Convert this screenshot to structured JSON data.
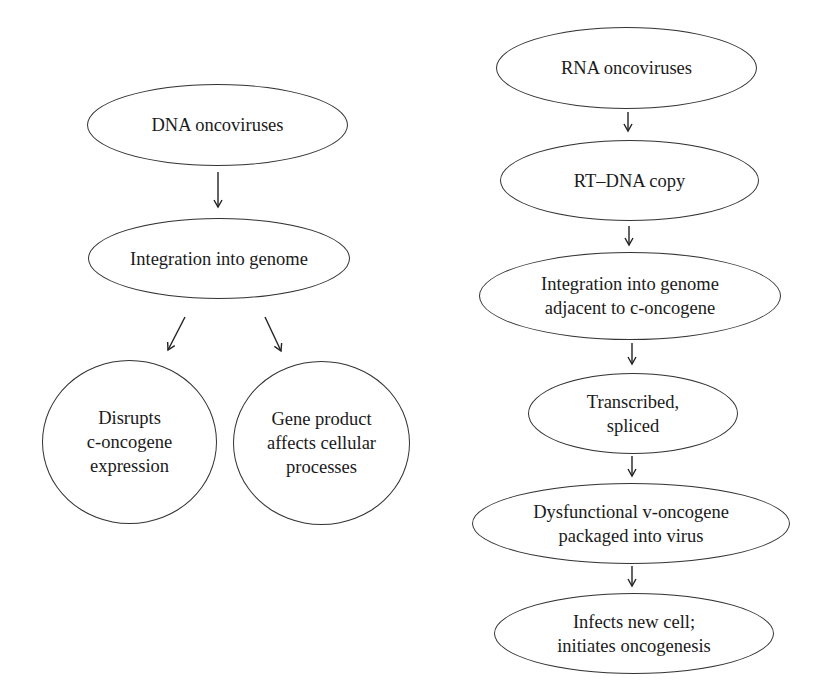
{
  "diagram": {
    "left_flow": {
      "nodes": [
        {
          "id": "dna-oncoviruses",
          "label": "DNA oncoviruses"
        },
        {
          "id": "integration-into-genome",
          "label": "Integration into genome"
        },
        {
          "id": "disrupts-c-oncogene",
          "label": "Disrupts\nc-oncogene\nexpression"
        },
        {
          "id": "gene-product-affects",
          "label": "Gene product\naffects cellular\nprocesses"
        }
      ],
      "edges": [
        {
          "from": "dna-oncoviruses",
          "to": "integration-into-genome"
        },
        {
          "from": "integration-into-genome",
          "to": "disrupts-c-oncogene"
        },
        {
          "from": "integration-into-genome",
          "to": "gene-product-affects"
        }
      ]
    },
    "right_flow": {
      "nodes": [
        {
          "id": "rna-oncoviruses",
          "label": "RNA oncoviruses"
        },
        {
          "id": "rt-dna-copy",
          "label": "RT–DNA copy"
        },
        {
          "id": "integration-adjacent",
          "label": "Integration into genome\nadjacent to c-oncogene"
        },
        {
          "id": "transcribed-spliced",
          "label": "Transcribed,\nspliced"
        },
        {
          "id": "dysfunctional-v-oncogene",
          "label": "Dysfunctional v-oncogene\npackaged into virus"
        },
        {
          "id": "infects-new-cell",
          "label": "Infects new cell;\ninitiates oncogenesis"
        }
      ],
      "edges": [
        {
          "from": "rna-oncoviruses",
          "to": "rt-dna-copy"
        },
        {
          "from": "rt-dna-copy",
          "to": "integration-adjacent"
        },
        {
          "from": "integration-adjacent",
          "to": "transcribed-spliced"
        },
        {
          "from": "transcribed-spliced",
          "to": "dysfunctional-v-oncogene"
        },
        {
          "from": "dysfunctional-v-oncogene",
          "to": "infects-new-cell"
        }
      ]
    }
  }
}
